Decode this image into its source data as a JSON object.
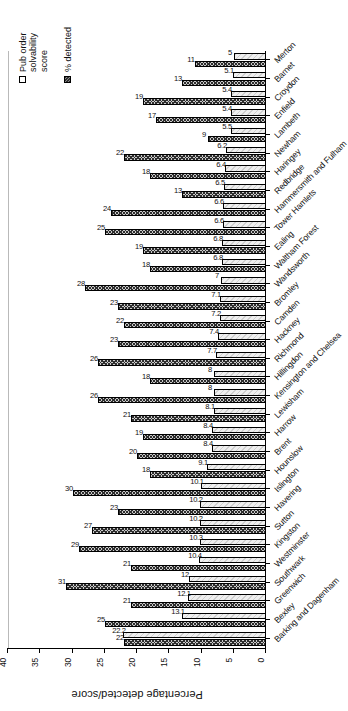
{
  "chart_data": {
    "type": "bar",
    "title": "",
    "xlabel": "",
    "ylabel": "Percentage detected/score",
    "ylim": [
      0,
      40
    ],
    "yticks": [
      0,
      5,
      10,
      15,
      20,
      25,
      30,
      35,
      40
    ],
    "grid": true,
    "orientation": "vertical",
    "legend_position": "top-right",
    "categories": [
      "Barking and Dagenham",
      "Bexley",
      "Greenwich",
      "Southwark",
      "Westminster",
      "Kingston",
      "Sutton",
      "Havering",
      "Islington",
      "Hounslow",
      "Brent",
      "Harrow",
      "Lewisham",
      "Kensington and Chelsea",
      "Hillingdon",
      "Richmond",
      "Hackney",
      "Camden",
      "Bromley",
      "Wandsworth",
      "Waltham Forest",
      "Ealing",
      "Tower Hamlets",
      "Hammersmith and Fulham",
      "Redbridge",
      "Haringey",
      "Newham",
      "Lambeth",
      "Enfield",
      "Croydon",
      "Barnet",
      "Merton"
    ],
    "series": [
      {
        "name": "Pub order solvability score",
        "values": [
          22,
          25,
          21,
          31,
          21,
          29,
          27,
          23,
          30,
          18,
          20,
          19,
          21,
          26,
          18,
          26,
          23,
          22,
          23,
          28,
          18,
          19,
          25,
          24,
          13,
          18,
          22,
          9,
          17,
          19,
          13,
          11
        ],
        "labels": [
          "22",
          "25",
          "21",
          "31",
          "21",
          "29",
          "27",
          "23",
          "30",
          "18",
          "20",
          "19",
          "21",
          "26",
          "18",
          "26",
          "23",
          "22",
          "23",
          "28",
          "18",
          "19",
          "25",
          "24",
          "13",
          "18",
          "22",
          "9",
          "17",
          "19",
          "13",
          "11"
        ]
      },
      {
        "name": "% detected",
        "values": [
          22.2,
          13.1,
          12.1,
          12,
          10.4,
          10.3,
          10.2,
          10.2,
          10.1,
          9.1,
          8.4,
          8.4,
          8.1,
          8,
          8,
          7.7,
          7.4,
          7.2,
          7.1,
          7,
          6.8,
          6.8,
          6.6,
          6.6,
          6.5,
          6.4,
          6.2,
          5.5,
          5.4,
          5.4,
          5.1,
          5
        ],
        "labels": [
          "22.2",
          "13.1",
          "12.1",
          "12",
          "10.4",
          "10.3",
          "10.2",
          "10.2",
          "10.1",
          "9.1",
          "8.4",
          "8.4",
          "8.1",
          "8",
          "8",
          "7.7",
          "7.4",
          "7.2",
          "7.1",
          "7",
          "6.8",
          "6.8",
          "6.6",
          "6.6",
          "6.5",
          "6.4",
          "6.2",
          "5.5",
          "5.4",
          "5.4",
          "5.1",
          "5"
        ]
      }
    ]
  },
  "legend": {
    "items": [
      {
        "label": "Pub order solvability score",
        "swatch": "score"
      },
      {
        "label": "% detected",
        "swatch": "detected"
      }
    ]
  },
  "axis": {
    "value_axis_title": "Percentage detected/score"
  },
  "colors": {
    "score_fill": "#c9c9c9",
    "score_hatch": "#2e2e2e",
    "detected_fill": "#efefef",
    "gridline": "#b9b9b9",
    "axis": "#000000",
    "text": "#111111"
  }
}
